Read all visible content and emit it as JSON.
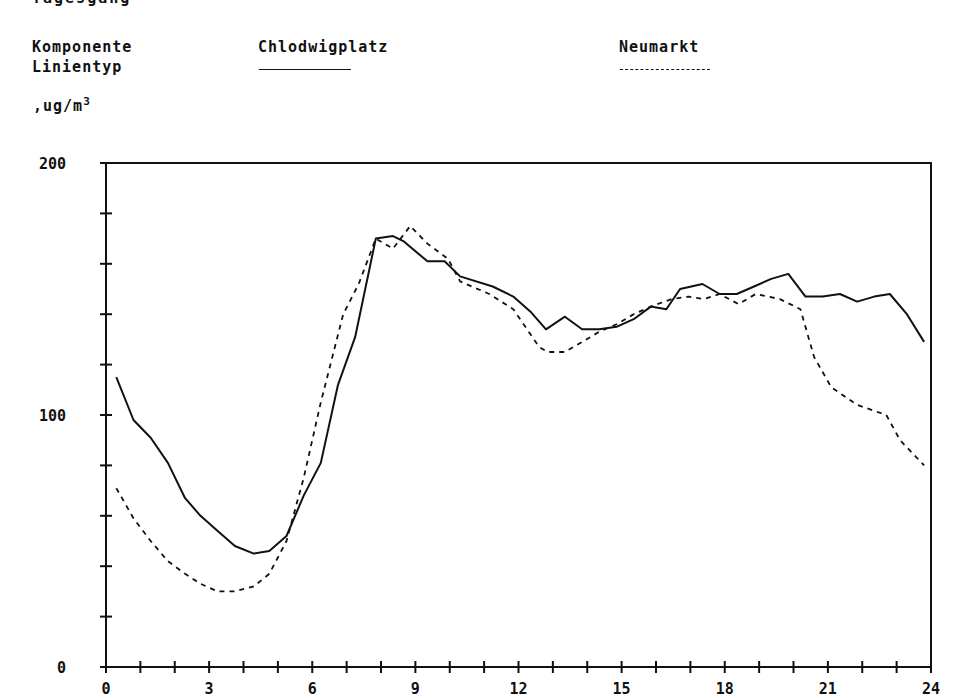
{
  "header": {
    "clipped_title": "Tagesgang   ",
    "legend_label_component": "Komponente",
    "legend_label_linetype": "Linientyp",
    "unit_base": ",ug/m",
    "unit_sup": "3"
  },
  "legend": [
    {
      "name": "Chlodwigplatz",
      "line_style": "solid"
    },
    {
      "name": "Neumarkt",
      "line_style": "dashed"
    }
  ],
  "colors": {
    "line": "#111111",
    "background": "#ffffff"
  },
  "chart_data": {
    "type": "line",
    "title": "",
    "xlabel": "",
    "ylabel": ",ug/m3",
    "xlim": [
      0,
      24
    ],
    "ylim": [
      0,
      200
    ],
    "x_tick_labels": [
      "0",
      "3",
      "6",
      "9",
      "12",
      "15",
      "18",
      "21",
      "24"
    ],
    "x_ticks_major": [
      0,
      3,
      6,
      9,
      12,
      15,
      18,
      21,
      24
    ],
    "x_ticks_minor_step": 1,
    "y_tick_labels": [
      "0",
      "100",
      "200"
    ],
    "y_ticks_major": [
      0,
      100,
      200
    ],
    "y_ticks_minor_step": 20,
    "grid": false,
    "legend_position": "top",
    "series": [
      {
        "name": "Chlodwigplatz",
        "line_style": "solid",
        "x": [
          0.3,
          0.8,
          1.3,
          1.8,
          2.3,
          2.75,
          3.25,
          3.75,
          4.3,
          4.75,
          5.25,
          5.75,
          6.25,
          6.75,
          7.25,
          7.85,
          8.35,
          8.65,
          9.35,
          9.85,
          10.3,
          11.25,
          11.85,
          12.35,
          12.8,
          13.35,
          13.85,
          14.35,
          14.85,
          15.35,
          15.85,
          16.3,
          16.7,
          17.35,
          17.85,
          18.35,
          18.85,
          19.35,
          19.85,
          20.35,
          20.85,
          21.35,
          21.85,
          22.35,
          22.8,
          23.3,
          23.8
        ],
        "values": [
          115,
          98,
          91,
          81,
          67,
          60,
          54,
          48,
          45,
          46,
          52,
          68,
          81,
          112,
          131,
          170,
          171,
          169,
          161,
          161,
          155,
          151,
          147,
          141,
          134,
          139,
          134,
          134,
          135,
          138,
          143,
          142,
          150,
          152,
          148,
          148,
          151,
          154,
          156,
          147,
          147,
          148,
          145,
          147,
          148,
          140,
          129
        ]
      },
      {
        "name": "Neumarkt",
        "line_style": "dashed",
        "x": [
          0.3,
          0.8,
          1.3,
          1.8,
          2.3,
          2.75,
          3.25,
          3.75,
          4.3,
          4.75,
          5.25,
          5.75,
          6.25,
          6.9,
          7.35,
          7.85,
          8.35,
          8.85,
          9.35,
          9.95,
          10.3,
          11.15,
          11.85,
          12.25,
          12.6,
          12.85,
          13.35,
          13.85,
          14.35,
          14.85,
          15.35,
          15.85,
          16.45,
          16.95,
          17.4,
          17.85,
          18.4,
          18.9,
          19.6,
          19.9,
          20.2,
          20.6,
          21.1,
          21.85,
          22.7,
          23.1,
          23.8
        ],
        "values": [
          71,
          59,
          50,
          42,
          37,
          33,
          30,
          30,
          32,
          37,
          50,
          75,
          105,
          140,
          152,
          170,
          166,
          175,
          168,
          162,
          153,
          148,
          142,
          134,
          127,
          125,
          125,
          129,
          133,
          136,
          140,
          143,
          146,
          147,
          146,
          148,
          144,
          148,
          146,
          144,
          142,
          123,
          111,
          104,
          100,
          90,
          80
        ]
      }
    ]
  }
}
